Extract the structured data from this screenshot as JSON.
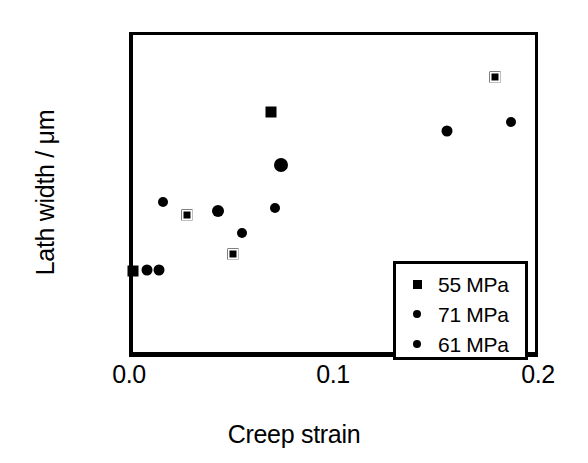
{
  "chart_data": {
    "type": "scatter",
    "title": "",
    "xlabel": "Creep strain",
    "ylabel": "Lath width / μm",
    "xlim": [
      0.0,
      0.2
    ],
    "ylim": [
      0,
      4
    ],
    "xticks": [
      "0.0",
      "0.1",
      "0.2"
    ],
    "xtick_values": [
      0.0,
      0.1,
      0.2
    ],
    "yticks": [
      "0",
      "1",
      "2",
      "3",
      "4"
    ],
    "ytick_values": [
      0,
      1,
      2,
      3,
      4
    ],
    "grid": false,
    "legend_position": "lower-right",
    "series": [
      {
        "name": "55 MPa",
        "marker": "square",
        "points": [
          {
            "x": 0.0,
            "y": 1.1
          },
          {
            "x": 0.0265,
            "y": 1.79
          },
          {
            "x": 0.049,
            "y": 1.31
          },
          {
            "x": 0.0675,
            "y": 3.05
          },
          {
            "x": 0.177,
            "y": 3.48
          }
        ]
      },
      {
        "name": "71 MPa",
        "marker": "circle",
        "points": [
          {
            "x": 0.007,
            "y": 1.11
          },
          {
            "x": 0.0127,
            "y": 1.11
          },
          {
            "x": 0.0416,
            "y": 1.83
          },
          {
            "x": 0.0724,
            "y": 2.4
          },
          {
            "x": 0.1535,
            "y": 2.82
          }
        ]
      },
      {
        "name": "61 MPa",
        "marker": "circle",
        "points": [
          {
            "x": 0.0147,
            "y": 1.94
          },
          {
            "x": 0.0533,
            "y": 1.56
          },
          {
            "x": 0.0695,
            "y": 1.87
          },
          {
            "x": 0.1848,
            "y": 2.93
          }
        ]
      }
    ]
  },
  "axes": {
    "x_title": "Creep strain",
    "y_title": "Lath width / μm",
    "x_tick_labels": [
      "0.0",
      "0.1",
      "0.2"
    ],
    "y_tick_labels": [
      "0",
      "1",
      "2",
      "3",
      "4"
    ]
  },
  "legend": {
    "entries": [
      {
        "label": "55 MPa",
        "marker": "square-marker"
      },
      {
        "label": "71 MPa",
        "marker": "circle-marker"
      },
      {
        "label": "61 MPa",
        "marker": "circle-marker"
      }
    ]
  },
  "colors": {
    "ink": "#000000",
    "background": "#ffffff"
  }
}
